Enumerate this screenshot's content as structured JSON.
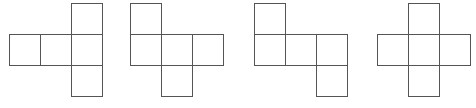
{
  "diagram": {
    "cell_size": 31,
    "line_color": "#555555",
    "background": "#ffffff",
    "figures": [
      {
        "id": "net-1",
        "origin": [
          9,
          3
        ],
        "cells": [
          [
            2,
            0
          ],
          [
            0,
            1
          ],
          [
            1,
            1
          ],
          [
            2,
            1
          ],
          [
            2,
            2
          ]
        ]
      },
      {
        "id": "net-2",
        "origin": [
          130,
          3
        ],
        "cells": [
          [
            0,
            0
          ],
          [
            0,
            1
          ],
          [
            1,
            1
          ],
          [
            2,
            1
          ],
          [
            1,
            2
          ]
        ]
      },
      {
        "id": "net-3",
        "origin": [
          254,
          3
        ],
        "cells": [
          [
            0,
            0
          ],
          [
            0,
            1
          ],
          [
            1,
            1
          ],
          [
            2,
            1
          ],
          [
            2,
            2
          ]
        ]
      },
      {
        "id": "net-4",
        "origin": [
          377,
          3
        ],
        "cells": [
          [
            1,
            0
          ],
          [
            0,
            1
          ],
          [
            1,
            1
          ],
          [
            2,
            1
          ],
          [
            1,
            2
          ]
        ]
      }
    ]
  }
}
